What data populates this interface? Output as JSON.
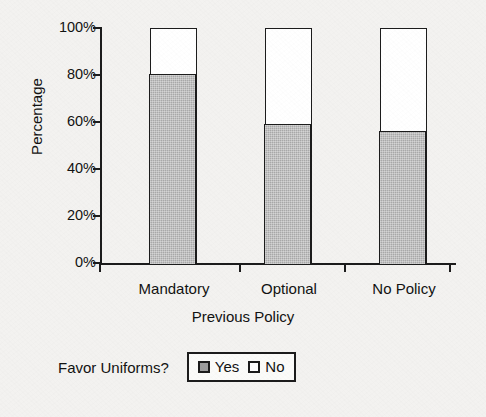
{
  "chart_data": {
    "type": "bar",
    "subtype": "stacked-bar-100-percent",
    "title": "",
    "xlabel": "Previous Policy",
    "ylabel": "Percentage",
    "categories": [
      "Mandatory",
      "Optional",
      "No Policy"
    ],
    "series": [
      {
        "name": "Yes",
        "values": [
          80,
          59,
          56
        ],
        "color": "#a9a9a9"
      },
      {
        "name": "No",
        "values": [
          20,
          41,
          44
        ],
        "color": "#ffffff"
      }
    ],
    "ylim": [
      0,
      100
    ],
    "ytick_labels": [
      "100%",
      "80%",
      "60%",
      "40%",
      "20%",
      "0%"
    ],
    "ytick_values": [
      100,
      80,
      60,
      40,
      20,
      0
    ],
    "grid": false,
    "legend_position": "bottom",
    "legend_title": "Favor Uniforms?",
    "legend_entries": [
      {
        "label": "Yes",
        "swatch": "gray-filled-square"
      },
      {
        "label": "No",
        "swatch": "white-empty-square"
      }
    ]
  },
  "axes": {
    "y_title": "Percentage",
    "x_title": "Previous Policy"
  },
  "colors": {
    "background": "#f3f2f0",
    "ink": "#1c1c1c",
    "yes_fill": "#a9a9a9",
    "no_fill": "#ffffff"
  }
}
